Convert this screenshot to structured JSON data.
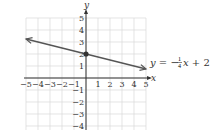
{
  "chart_data": {
    "type": "line",
    "title": "",
    "xlabel": "x",
    "ylabel": "y",
    "xlim": [
      -5,
      5
    ],
    "ylim": [
      -4,
      5
    ],
    "grid": true,
    "x_ticks": [
      "-5",
      "-4",
      "-3",
      "-2",
      "-1",
      "1",
      "2",
      "3",
      "4",
      "5"
    ],
    "y_ticks": [
      "5",
      "4",
      "3",
      "2",
      "1",
      "-1",
      "-2",
      "-3",
      "-4"
    ],
    "series": [
      {
        "name": "y = -1/4 x + 2",
        "equation": "y = −¼x + 2",
        "slope": -0.25,
        "intercept": 2,
        "x": [
          -5,
          0,
          5
        ],
        "y": [
          3.25,
          2,
          0.75
        ],
        "arrows_both_ends": true,
        "highlighted_point": {
          "x": 0,
          "y": 2
        }
      }
    ],
    "annotations": [
      {
        "text": "y = −¼x + 2",
        "position": "right of line end"
      }
    ]
  },
  "labels": {
    "x_axis": "x",
    "y_axis": "y",
    "eq_y": "y",
    "eq_equals": " = −",
    "eq_num": "1",
    "eq_den": "4",
    "eq_x": "x",
    "eq_tail": " + 2"
  },
  "colors": {
    "grid": "#d8d8d8",
    "axis": "#333333",
    "line": "#555555",
    "point": "#333333"
  }
}
